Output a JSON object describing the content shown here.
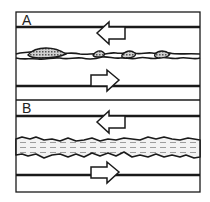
{
  "panels": [
    {
      "label": "A",
      "description": "Two plates moving in opposite directions; fault with isolated patches of gouge/asperities",
      "top_arrow": "left",
      "bottom_arrow": "right"
    },
    {
      "label": "B",
      "description": "Two plates moving in opposite directions; continuous fluid/gouge-filled fault zone",
      "top_arrow": "left",
      "bottom_arrow": "right"
    }
  ],
  "colors": {
    "line": "#1a1a1a",
    "fill_patch": "#9a9a9a",
    "fill_zone": "#e6e6e6",
    "background": "#ffffff"
  }
}
